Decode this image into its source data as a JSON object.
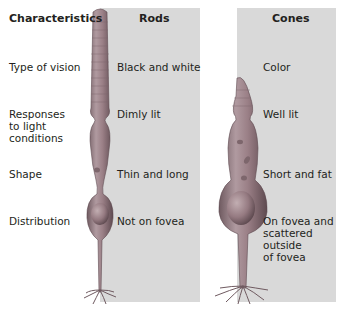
{
  "header": {
    "characteristics": "Characteristics",
    "rods": "Rods",
    "cones": "Cones"
  },
  "rows": [
    {
      "label": "Type of vision",
      "rods": "Black and white",
      "cones": "Color"
    },
    {
      "label_lines": [
        "Responses",
        "to light",
        "conditions"
      ],
      "rods": "Dimly lit",
      "cones": "Well lit"
    },
    {
      "label": "Shape",
      "rods": "Thin and long",
      "cones": "Short and fat"
    },
    {
      "label": "Distribution",
      "rods": "Not on fovea",
      "cones_lines": [
        "On fovea and",
        "scattered",
        "outside",
        "of fovea"
      ]
    }
  ],
  "colors": {
    "panel": "#d9d9d9",
    "cell_body": "#9a7f86",
    "cell_shadow": "#6f5a60",
    "cell_highlight": "#c2aeb2"
  }
}
